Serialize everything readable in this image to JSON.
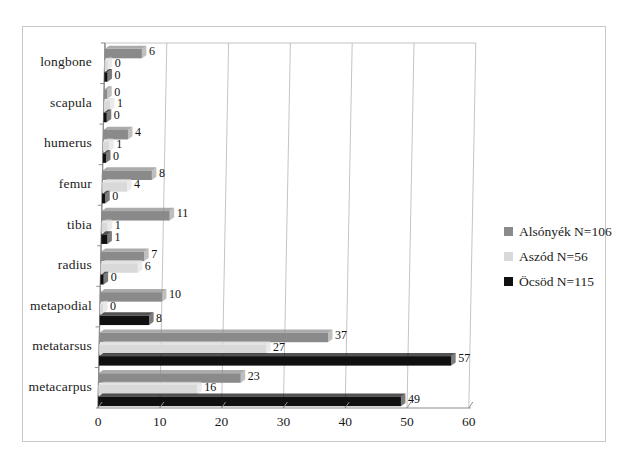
{
  "chart_data": {
    "type": "bar",
    "orientation": "horizontal",
    "title": "",
    "xlabel": "",
    "ylabel": "",
    "xlim": [
      0,
      60
    ],
    "xticks": [
      0,
      10,
      20,
      30,
      40,
      50,
      60
    ],
    "grid": true,
    "legend_position": "right",
    "categories": [
      "longbone",
      "scapula",
      "humerus",
      "femur",
      "tibia",
      "radius",
      "metapodial",
      "metatarsus",
      "metacarpus"
    ],
    "series": [
      {
        "name": "Alsónyék N=106",
        "color": "#8a8a8a",
        "values": [
          6,
          0,
          4,
          8,
          11,
          7,
          10,
          37,
          23
        ]
      },
      {
        "name": "Aszód N=56",
        "color": "#d9d9d9",
        "values": [
          0,
          1,
          1,
          4,
          1,
          6,
          0,
          27,
          16
        ]
      },
      {
        "name": "Öcsöd N=115",
        "color": "#101010",
        "values": [
          0,
          0,
          0,
          0,
          1,
          0,
          8,
          57,
          49
        ]
      }
    ]
  },
  "legend": {
    "items": [
      {
        "label": "Alsónyék N=106",
        "color": "#8a8a8a"
      },
      {
        "label": "Aszód N=56",
        "color": "#d9d9d9"
      },
      {
        "label": "Öcsöd N=115",
        "color": "#101010"
      }
    ]
  },
  "axis": {
    "x_tick_labels": [
      "0",
      "10",
      "20",
      "30",
      "40",
      "50",
      "60"
    ],
    "y_tick_labels": [
      "longbone",
      "scapula",
      "humerus",
      "femur",
      "tibia",
      "radius",
      "metapodial",
      "metatarsus",
      "metacarpus"
    ]
  },
  "top_cut_text": ""
}
